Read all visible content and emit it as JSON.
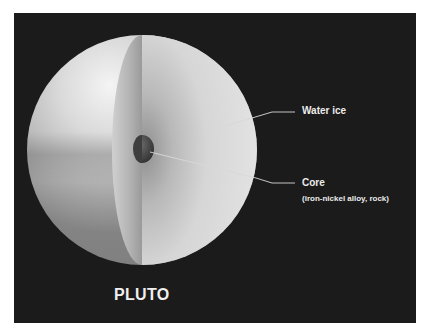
{
  "diagram": {
    "title": "PLUTO",
    "layers": [
      {
        "name": "Water ice",
        "label": "Water ice",
        "description": ""
      },
      {
        "name": "Core",
        "label": "Core",
        "description": "(iron-nickel alloy, rock)"
      }
    ],
    "colors": {
      "background": "#1b1b1b",
      "frame": "#ffffff",
      "sphere_light": "#e6e6e6",
      "sphere_mid": "#b8b8b8",
      "cut_face": "#c4c4c4",
      "core": "#4a4a4a",
      "label_text": "#ececec",
      "leader_line": "#d8d8d8"
    }
  }
}
